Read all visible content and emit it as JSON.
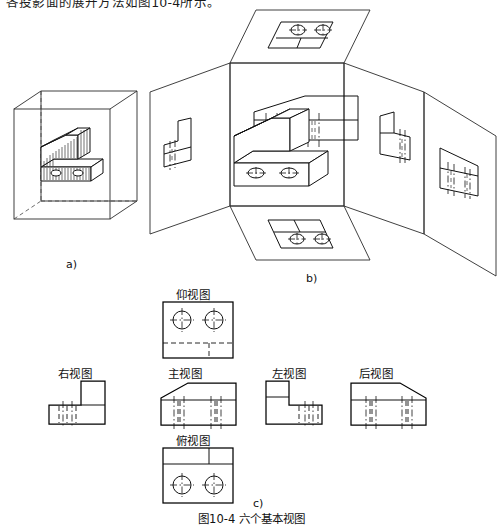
{
  "document": {
    "top_text": "各投影面的展开方法如图10-4所示。",
    "figure_caption": "图10-4    六个基本视图"
  },
  "panels": [
    {
      "id": "a",
      "caption": "a)",
      "description": "物体置于透明投影箱(玻璃箱)中"
    },
    {
      "id": "b",
      "caption": "b)",
      "description": "投影面展开"
    },
    {
      "id": "c",
      "caption": "c)",
      "description": "六个基本视图配置"
    }
  ],
  "views": {
    "bottom": {
      "label": "仰视图",
      "id": "bottom-view"
    },
    "right": {
      "label": "右视图",
      "id": "right-view"
    },
    "front": {
      "label": "主视图",
      "id": "front-view"
    },
    "left": {
      "label": "左视图",
      "id": "left-view"
    },
    "rear": {
      "label": "后视图",
      "id": "rear-view"
    },
    "top": {
      "label": "俯视图",
      "id": "top-view"
    }
  },
  "style": {
    "line_color": "#111111",
    "background": "#ffffff",
    "hidden_line": "dashed",
    "center_line": "dash-dot"
  }
}
